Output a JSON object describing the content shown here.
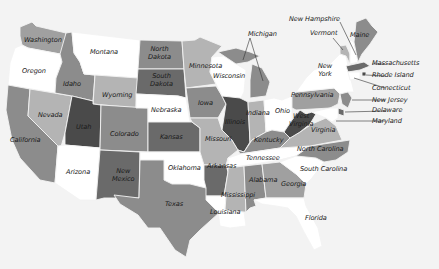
{
  "map": {
    "type": "choropleth",
    "region": "United States",
    "color_scale": "grayscale",
    "palette": {
      "white": "#ffffff",
      "light": "#b4b4b4",
      "mid_light": "#a0a0a0",
      "mid": "#8c8c8c",
      "dark": "#6a6a6a",
      "darkest": "#4a4a4a",
      "background": "#f3f3f3"
    },
    "states": [
      {
        "name": "Washington",
        "shade": "mid_light"
      },
      {
        "name": "Oregon",
        "shade": "white"
      },
      {
        "name": "California",
        "shade": "mid"
      },
      {
        "name": "Nevada",
        "shade": "light"
      },
      {
        "name": "Idaho",
        "shade": "mid"
      },
      {
        "name": "Montana",
        "shade": "white"
      },
      {
        "name": "Wyoming",
        "shade": "light"
      },
      {
        "name": "Utah",
        "shade": "darkest"
      },
      {
        "name": "Arizona",
        "shade": "white"
      },
      {
        "name": "Colorado",
        "shade": "mid"
      },
      {
        "name": "New Mexico",
        "shade": "dark"
      },
      {
        "name": "North Dakota",
        "shade": "mid"
      },
      {
        "name": "South Dakota",
        "shade": "dark"
      },
      {
        "name": "Nebraska",
        "shade": "white"
      },
      {
        "name": "Kansas",
        "shade": "dark"
      },
      {
        "name": "Oklahoma",
        "shade": "white"
      },
      {
        "name": "Texas",
        "shade": "mid"
      },
      {
        "name": "Minnesota",
        "shade": "light"
      },
      {
        "name": "Iowa",
        "shade": "mid"
      },
      {
        "name": "Missouri",
        "shade": "light"
      },
      {
        "name": "Arkansas",
        "shade": "dark"
      },
      {
        "name": "Louisiana",
        "shade": "white"
      },
      {
        "name": "Wisconsin",
        "shade": "white"
      },
      {
        "name": "Illinois",
        "shade": "darkest"
      },
      {
        "name": "Michigan",
        "shade": "mid"
      },
      {
        "name": "Indiana",
        "shade": "light"
      },
      {
        "name": "Ohio",
        "shade": "white"
      },
      {
        "name": "Kentucky",
        "shade": "mid"
      },
      {
        "name": "Tennessee",
        "shade": "white"
      },
      {
        "name": "Mississippi",
        "shade": "light"
      },
      {
        "name": "Alabama",
        "shade": "mid"
      },
      {
        "name": "Georgia",
        "shade": "mid_light"
      },
      {
        "name": "Florida",
        "shade": "white"
      },
      {
        "name": "South Carolina",
        "shade": "white"
      },
      {
        "name": "North Carolina",
        "shade": "mid"
      },
      {
        "name": "Virginia",
        "shade": "light"
      },
      {
        "name": "West Virginia",
        "shade": "darkest"
      },
      {
        "name": "Pennsylvania",
        "shade": "mid_light"
      },
      {
        "name": "New York",
        "shade": "white"
      },
      {
        "name": "Vermont",
        "shade": "light"
      },
      {
        "name": "New Hampshire",
        "shade": "white"
      },
      {
        "name": "Maine",
        "shade": "mid"
      },
      {
        "name": "Massachusetts",
        "shade": "dark"
      },
      {
        "name": "Rhode Island",
        "shade": "darkest"
      },
      {
        "name": "Connecticut",
        "shade": "white"
      },
      {
        "name": "New Jersey",
        "shade": "mid"
      },
      {
        "name": "Delaware",
        "shade": "dark"
      },
      {
        "name": "Maryland",
        "shade": "white"
      }
    ],
    "labels": {
      "washington": "Washington",
      "oregon": "Oregon",
      "california": "California",
      "nevada": "Nevada",
      "idaho": "Idaho",
      "montana": "Montana",
      "wyoming": "Wyoming",
      "utah": "Utah",
      "arizona": "Arizona",
      "colorado": "Colorado",
      "new_mexico_1": "New",
      "new_mexico_2": "Mexico",
      "north_dakota_1": "North",
      "north_dakota_2": "Dakota",
      "south_dakota_1": "South",
      "south_dakota_2": "Dakota",
      "nebraska": "Nebraska",
      "kansas": "Kansas",
      "oklahoma": "Oklahoma",
      "texas": "Texas",
      "minnesota": "Minnesota",
      "iowa": "Iowa",
      "missouri": "Missouri",
      "arkansas": "Arkansas",
      "louisiana": "Louisiana",
      "wisconsin": "Wisconsin",
      "illinois": "Illinois",
      "michigan": "Michigan",
      "indiana": "Indiana",
      "ohio": "Ohio",
      "kentucky": "Kentucky",
      "tennessee": "Tennessee",
      "mississippi": "Mississippi",
      "alabama": "Alabama",
      "georgia": "Georgia",
      "florida": "Florida",
      "south_carolina": "South Carolina",
      "north_carolina": "North Carolina",
      "virginia": "Virginia",
      "west_virginia_1": "West",
      "west_virginia_2": "Virginia",
      "pennsylvania": "Pennsylvania",
      "new_york_1": "New",
      "new_york_2": "York",
      "vermont": "Vermont",
      "new_hampshire": "New Hampshire",
      "maine": "Maine",
      "massachusetts": "Massachusetts",
      "rhode_island": "Rhode Island",
      "connecticut": "Connecticut",
      "new_jersey": "New Jersey",
      "delaware": "Delaware",
      "maryland": "Maryland"
    }
  }
}
